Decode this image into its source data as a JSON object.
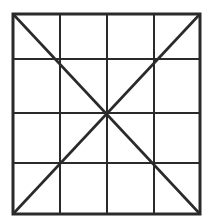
{
  "diagram": {
    "rows": 4,
    "cols": 4,
    "colors": {
      "line": "#2a2a2a",
      "background": "#ffffff"
    },
    "outer": {
      "x1": 13,
      "y1": 14,
      "x2": 200,
      "y2": 214,
      "stroke": 3
    },
    "vlines": [
      60,
      107,
      154
    ],
    "hlines": [
      59,
      113,
      163
    ],
    "inner_stroke": 2,
    "diagonal_stroke": 2.6
  }
}
